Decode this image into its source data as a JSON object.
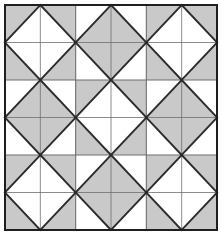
{
  "figure": {
    "name": "diamond-checkerboard-tiling",
    "title": "Diamond-in-square checkerboard tiling",
    "canvas": {
      "width": 222,
      "height": 235
    },
    "plot_area": {
      "x": 5,
      "y": 5,
      "width": 212,
      "height": 225
    },
    "grid": {
      "rows": 3,
      "cols": 3,
      "cell_width": 70.67,
      "cell_height": 75.0
    }
  },
  "colors": {
    "background": "#ffffff",
    "fill_gray": "#c9c9c9",
    "fill_white": "#ffffff",
    "line_dark": "#2b2b2b",
    "line_grid": "#6e6e6e",
    "frame": "#1f1f1f"
  },
  "strokes": {
    "frame_width": 2.0,
    "diagonal_width": 1.9,
    "cell_grid_width": 1.1,
    "half_grid_width": 0.8
  },
  "chart_data": {
    "type": "heatmap",
    "title": "Diamond-in-square checkerboard tiling",
    "xlabel": "",
    "ylabel": "",
    "legend": [
      {
        "label": "white diamond on gray ground",
        "value": 0,
        "color": "#c9c9c9"
      },
      {
        "label": "gray diamond on white ground",
        "value": 1,
        "color": "#ffffff"
      }
    ],
    "categories_x": [
      "col-1",
      "col-2",
      "col-3"
    ],
    "categories_y": [
      "row-1",
      "row-2",
      "row-3"
    ],
    "values": [
      [
        0,
        1,
        0
      ],
      [
        1,
        0,
        1
      ],
      [
        0,
        1,
        0
      ]
    ],
    "cells": [
      {
        "row": 0,
        "col": 0,
        "tile": "white-diamond-on-gray",
        "ground": "#c9c9c9",
        "diamond": "#ffffff"
      },
      {
        "row": 0,
        "col": 1,
        "tile": "gray-diamond-on-white",
        "ground": "#ffffff",
        "diamond": "#c9c9c9"
      },
      {
        "row": 0,
        "col": 2,
        "tile": "white-diamond-on-gray",
        "ground": "#c9c9c9",
        "diamond": "#ffffff"
      },
      {
        "row": 1,
        "col": 0,
        "tile": "gray-diamond-on-white",
        "ground": "#ffffff",
        "diamond": "#c9c9c9"
      },
      {
        "row": 1,
        "col": 1,
        "tile": "white-diamond-on-gray",
        "ground": "#c9c9c9",
        "diamond": "#ffffff"
      },
      {
        "row": 1,
        "col": 2,
        "tile": "gray-diamond-on-white",
        "ground": "#ffffff",
        "diamond": "#c9c9c9"
      },
      {
        "row": 2,
        "col": 0,
        "tile": "white-diamond-on-gray",
        "ground": "#c9c9c9",
        "diamond": "#ffffff"
      },
      {
        "row": 2,
        "col": 1,
        "tile": "gray-diamond-on-white",
        "ground": "#ffffff",
        "diamond": "#c9c9c9"
      },
      {
        "row": 2,
        "col": 2,
        "tile": "white-diamond-on-gray",
        "ground": "#c9c9c9",
        "diamond": "#ffffff"
      }
    ],
    "grid": true,
    "legend_position": "none"
  }
}
